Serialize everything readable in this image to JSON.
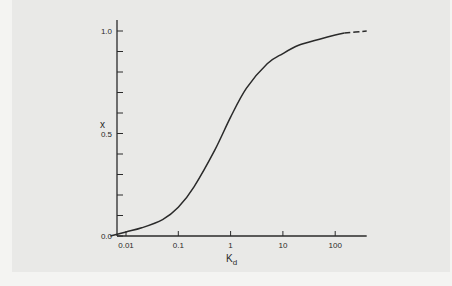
{
  "chart_data": {
    "type": "line",
    "title": "",
    "xlabel": "K",
    "xlabel_subscript": "d",
    "ylabel": "x",
    "xscale": "log",
    "xlim": [
      0.005,
      400
    ],
    "ylim": [
      0.0,
      1.0
    ],
    "grid": false,
    "legend": null,
    "x_ticks": [
      0.01,
      0.1,
      1,
      10,
      100
    ],
    "x_tick_labels": [
      "0.01",
      "0.1",
      "1",
      "10",
      "100"
    ],
    "y_ticks": [
      0.0,
      0.1,
      0.2,
      0.3,
      0.4,
      0.5,
      0.6,
      0.7,
      0.8,
      0.9,
      1.0
    ],
    "y_tick_labels": [
      "0.0",
      "",
      "",
      "",
      "",
      "0.5",
      "",
      "",
      "",
      "",
      "1.0"
    ],
    "series": [
      {
        "name": "x vs Kd",
        "style": "solid",
        "x": [
          0.005,
          0.01,
          0.02,
          0.05,
          0.1,
          0.2,
          0.5,
          1,
          2,
          5,
          10,
          20,
          50,
          100,
          150
        ],
        "y": [
          0.0,
          0.02,
          0.04,
          0.08,
          0.14,
          0.24,
          0.42,
          0.58,
          0.72,
          0.84,
          0.89,
          0.93,
          0.96,
          0.98,
          0.99
        ]
      },
      {
        "name": "extrapolation",
        "style": "dashed",
        "x": [
          150,
          400
        ],
        "y": [
          0.99,
          1.0
        ]
      }
    ],
    "annotations": []
  },
  "caption": "Fig. ..."
}
